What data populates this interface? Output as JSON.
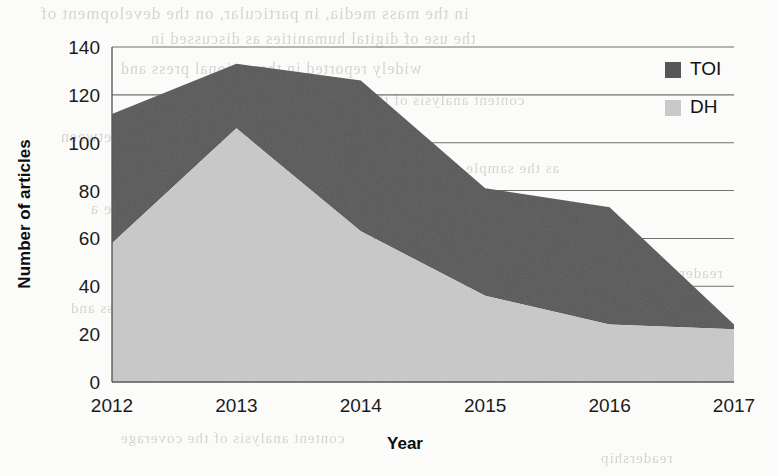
{
  "chart_data": {
    "type": "area",
    "stacked": true,
    "title": "",
    "subtitle": "",
    "xlabel": "Year",
    "ylabel": "Number of articles",
    "categories": [
      "2012",
      "2013",
      "2014",
      "2015",
      "2016",
      "2017"
    ],
    "x": [
      2012,
      2013,
      2014,
      2015,
      2016,
      2017
    ],
    "series": [
      {
        "name": "DH",
        "color": "#c9c9c9",
        "values": [
          58,
          106,
          63,
          36,
          24,
          22
        ],
        "note": "lower (light gray) band of the stacked area"
      },
      {
        "name": "TOI",
        "color": "#575757",
        "values": [
          54,
          27,
          63,
          45,
          49,
          2
        ],
        "cumulative_top": [
          112,
          133,
          126,
          81,
          73,
          24
        ],
        "note": "upper (dark gray) band; cumulative_top is the stacked total"
      }
    ],
    "totals": [
      112,
      133,
      126,
      81,
      73,
      24
    ],
    "ylim": [
      0,
      140
    ],
    "ytick_step": 20,
    "yticks": [
      "0",
      "20",
      "40",
      "60",
      "80",
      "100",
      "120",
      "140"
    ],
    "xticks": [
      "2012",
      "2013",
      "2014",
      "2015",
      "2016",
      "2017"
    ],
    "grid": "horizontal",
    "legend_position": "top-right-inside",
    "legend": [
      {
        "label": "TOI",
        "color": "#575757",
        "swatch": "legend-swatch-toi"
      },
      {
        "label": "DH",
        "color": "#c9c9c9",
        "swatch": "legend-swatch-dh"
      }
    ]
  },
  "colors": {
    "series_toi": "#575757",
    "series_dh": "#c9c9c9",
    "grid": "#6f6f6f",
    "text": "#141414",
    "background": "#fbfbfa"
  },
  "background_bleed": {
    "note": "faint show-through text from the reverse side of the scanned page",
    "lines": [
      "in the mass media, in particular, on the development of",
      "the use of digital humanities as discussed in",
      "widely reported in the national press and",
      "content analysis of the coverage",
      "of the articles published between",
      "as the sample was limited",
      "considered to be a",
      "the findings",
      "readership"
    ]
  }
}
